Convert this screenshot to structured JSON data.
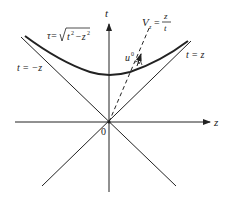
{
  "diagram": {
    "axes": {
      "horizontal_label": "z",
      "vertical_label": "t",
      "origin_label": "0"
    },
    "lines": {
      "light_cone_right": "t = z",
      "light_cone_left": "t = −z"
    },
    "hyperbola": {
      "label_prefix": "τ=",
      "label_radicand": "t",
      "label_exp1": "2",
      "label_minus": "−z",
      "label_exp2": "2"
    },
    "worldline": {
      "velocity_label_V": "V",
      "velocity_label_sub": "z",
      "velocity_label_eq": "=",
      "velocity_numerator": "z",
      "velocity_denominator": "t"
    },
    "four_velocity": {
      "label": "u",
      "superscript": "0"
    },
    "colors": {
      "stroke": "#222222",
      "background": "#ffffff"
    }
  }
}
